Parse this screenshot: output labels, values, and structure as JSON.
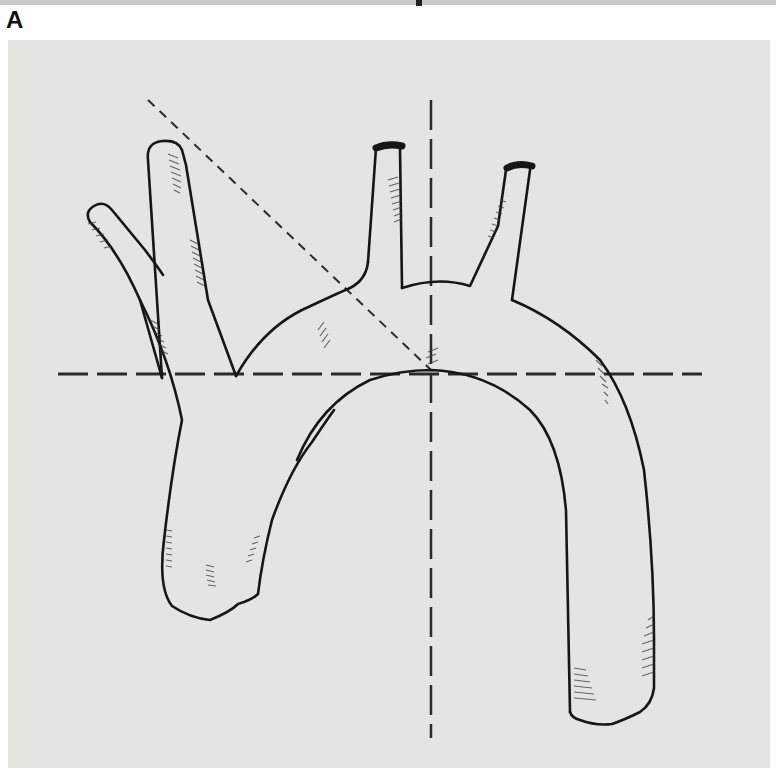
{
  "figure": {
    "panel_label": "A",
    "background_color": "#e4e4e2",
    "line_color": "#1a1a1a",
    "reference_lines": {
      "horizontal": {
        "style": "long-dash",
        "y": 374,
        "x_start": 58,
        "x_end": 702
      },
      "vertical": {
        "style": "long-dash",
        "x": 431,
        "y_start": 100,
        "y_end": 738
      },
      "diagonal": {
        "style": "short-dash",
        "from": [
          148,
          100
        ],
        "to": [
          431,
          370
        ]
      }
    },
    "structures": [
      {
        "name": "brachiocephalic-trunk"
      },
      {
        "name": "right-subclavian-branch"
      },
      {
        "name": "right-common-carotid-branch"
      },
      {
        "name": "left-common-carotid-artery"
      },
      {
        "name": "left-subclavian-artery"
      },
      {
        "name": "aortic-arch"
      },
      {
        "name": "ascending-aorta"
      },
      {
        "name": "descending-aorta"
      }
    ]
  }
}
